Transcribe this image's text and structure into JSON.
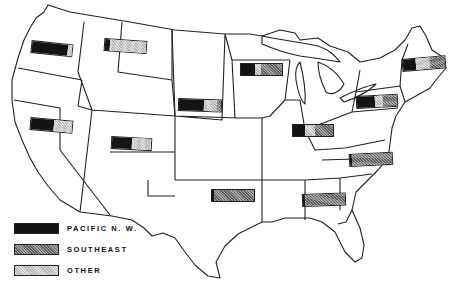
{
  "legend": {
    "items": [
      {
        "key": "pnw",
        "label": "PACIFIC  N. W."
      },
      {
        "key": "se",
        "label": "SOUTHEAST"
      },
      {
        "key": "other",
        "label": "OTHER"
      }
    ]
  },
  "colors": {
    "pacific_nw": "#141414",
    "southeast": "#8c8c8c",
    "other": "#cfcfcf",
    "outline": "#222222",
    "background": "#ffffff"
  },
  "regions": [
    {
      "id": "pacific-northwest",
      "x": 31,
      "y": 40,
      "w": 42,
      "angle": 6,
      "shares": {
        "pnw": 90,
        "se": 0,
        "other": 10
      }
    },
    {
      "id": "montana-wyoming",
      "x": 104,
      "y": 38,
      "w": 43,
      "angle": 4,
      "shares": {
        "pnw": 12,
        "se": 0,
        "other": 88
      }
    },
    {
      "id": "california-nevada",
      "x": 30,
      "y": 117,
      "w": 43,
      "angle": 5,
      "shares": {
        "pnw": 55,
        "se": 0,
        "other": 45
      }
    },
    {
      "id": "utah-colorado",
      "x": 111,
      "y": 136,
      "w": 41,
      "angle": 3,
      "shares": {
        "pnw": 50,
        "se": 0,
        "other": 50
      }
    },
    {
      "id": "northern-plains",
      "x": 178,
      "y": 98,
      "w": 44,
      "angle": 2,
      "shares": {
        "pnw": 60,
        "se": 10,
        "other": 30
      }
    },
    {
      "id": "upper-midwest",
      "x": 240,
      "y": 63,
      "w": 43,
      "angle": 0,
      "shares": {
        "pnw": 35,
        "se": 50,
        "other": 15
      }
    },
    {
      "id": "central",
      "x": 292,
      "y": 124,
      "w": 42,
      "angle": 0,
      "shares": {
        "pnw": 30,
        "se": 45,
        "other": 25
      }
    },
    {
      "id": "mid-atlantic",
      "x": 356,
      "y": 96,
      "w": 42,
      "angle": -3,
      "shares": {
        "pnw": 45,
        "se": 35,
        "other": 20
      }
    },
    {
      "id": "new-england",
      "x": 402,
      "y": 59,
      "w": 44,
      "angle": -5,
      "shares": {
        "pnw": 30,
        "se": 35,
        "other": 35
      }
    },
    {
      "id": "south-atlantic",
      "x": 349,
      "y": 154,
      "w": 44,
      "angle": -3,
      "shares": {
        "pnw": 5,
        "se": 95,
        "other": 0
      }
    },
    {
      "id": "south-central",
      "x": 211,
      "y": 189,
      "w": 44,
      "angle": 0,
      "shares": {
        "pnw": 5,
        "se": 95,
        "other": 0
      }
    },
    {
      "id": "deep-south",
      "x": 302,
      "y": 194,
      "w": 44,
      "angle": -2,
      "shares": {
        "pnw": 4,
        "se": 96,
        "other": 0
      }
    }
  ]
}
